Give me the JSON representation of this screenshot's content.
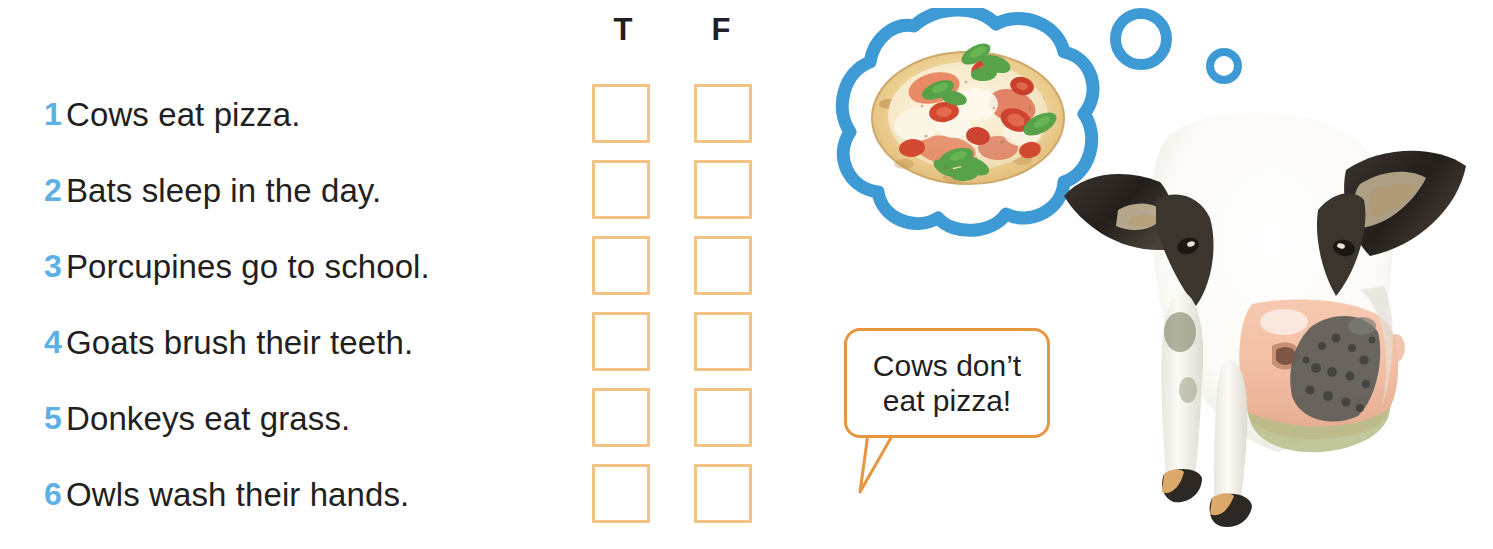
{
  "worksheet": {
    "columns": {
      "true_label": "T",
      "false_label": "F"
    },
    "questions": [
      {
        "number": "1",
        "text": "Cows eat pizza."
      },
      {
        "number": "2",
        "text": "Bats sleep in the day."
      },
      {
        "number": "3",
        "text": "Porcupines go to school."
      },
      {
        "number": "4",
        "text": "Goats brush their teeth."
      },
      {
        "number": "5",
        "text": "Donkeys eat grass."
      },
      {
        "number": "6",
        "text": "Owls wash their hands."
      }
    ]
  },
  "speech_bubble": {
    "text": "Cows don’t\neat pizza!"
  },
  "thought_bubble": {
    "content": "pizza-photo"
  },
  "illustration": {
    "animal": "cow-photo"
  },
  "colors": {
    "number_blue": "#5cb0e4",
    "checkbox_border": "#f2c384",
    "speech_bubble_border": "#e8953f",
    "thought_bubble_blue": "#3e9ad4",
    "text_black": "#231f20"
  }
}
